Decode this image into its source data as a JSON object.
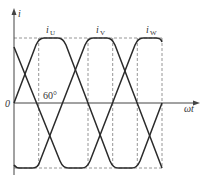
{
  "diagram": {
    "y_axis_label": "i",
    "x_axis_label": "ωt",
    "origin_label": "0",
    "angle_annotation": "60°",
    "phases": [
      {
        "name": "U",
        "label_main": "i",
        "label_sub": "U",
        "phase_shift_deg": 0
      },
      {
        "name": "V",
        "label_main": "i",
        "label_sub": "V",
        "phase_shift_deg": 120
      },
      {
        "name": "W",
        "label_main": "i",
        "label_sub": "W",
        "phase_shift_deg": 240
      }
    ],
    "waveform": {
      "shape": "trapezoidal",
      "ramp_deg": 60,
      "flat_top_deg": 60,
      "period_deg": 360
    },
    "dashed_guides_deg": [
      60,
      180,
      240,
      300,
      360
    ],
    "colors": {
      "curve": "#2b2b2b",
      "axis": "#444444",
      "dashed": "#8a8a8a"
    }
  }
}
